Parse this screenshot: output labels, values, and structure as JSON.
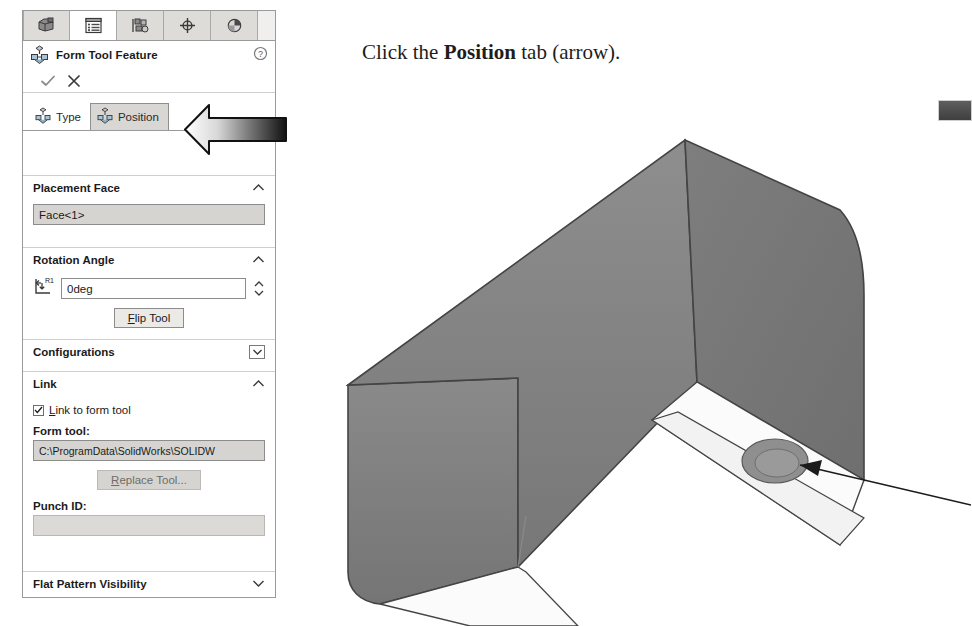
{
  "manager_tabs": [
    {
      "name": "feature-manager-design-tree",
      "icon": "part-cube-icon",
      "active": false
    },
    {
      "name": "property-manager",
      "icon": "property-list-icon",
      "active": true
    },
    {
      "name": "configuration-manager",
      "icon": "configuration-icon",
      "active": false
    },
    {
      "name": "display-manager",
      "icon": "crosshair-target-icon",
      "active": false
    },
    {
      "name": "appearances-manager",
      "icon": "appearance-sphere-icon",
      "active": false
    }
  ],
  "header": {
    "title": "Form Tool Feature",
    "icon": "form-tool-icon",
    "help_icon": "help-question-icon",
    "ok_icon": "checkmark-icon",
    "cancel_icon": "close-x-icon"
  },
  "property_tabs": [
    {
      "label": "Type",
      "selected": false
    },
    {
      "label": "Position",
      "selected": true
    }
  ],
  "sections": {
    "placement_face": {
      "title": "Placement Face",
      "collapse_icon": "chevron-up-icon",
      "value": "Face<1>"
    },
    "rotation_angle": {
      "title": "Rotation Angle",
      "collapse_icon": "chevron-up-icon",
      "icon_label": "R1",
      "value": "0deg",
      "flip_button": "Flip Tool"
    },
    "configurations": {
      "title": "Configurations",
      "collapse_icon": "chevron-down-boxed-icon"
    },
    "link": {
      "title": "Link",
      "collapse_icon": "chevron-up-icon",
      "checkbox_label": "Link to form tool",
      "checkbox_checked": true,
      "form_tool_label": "Form tool:",
      "form_tool_path": "C:\\ProgramData\\SolidWorks\\SOLIDW",
      "replace_button": "Replace Tool...",
      "punch_id_label": "Punch ID:",
      "punch_id_value": ""
    },
    "flat_pattern_visibility": {
      "title": "Flat Pattern Visibility",
      "collapse_icon": "chevron-down-icon"
    }
  },
  "instruction": {
    "before": "Click the ",
    "bold": "Position",
    "after": " tab (arrow)."
  },
  "callout": {
    "arrow_name": "position-tab-callout-arrow",
    "direction": "left",
    "fill": "white-to-black-gradient"
  },
  "model": {
    "description": "sheet metal u-channel part with circular emboss form feature",
    "leader_target": "circular-emboss-feature",
    "face_color": "#808080",
    "top_flange_color": "#fbfbfb"
  },
  "colors": {
    "panel_border": "#9a9a9a",
    "tab_active": "#ffffff",
    "tab_inactive": "#dedcd8",
    "field_grey": "#d6d4d0",
    "text": "#1b1b1b"
  }
}
